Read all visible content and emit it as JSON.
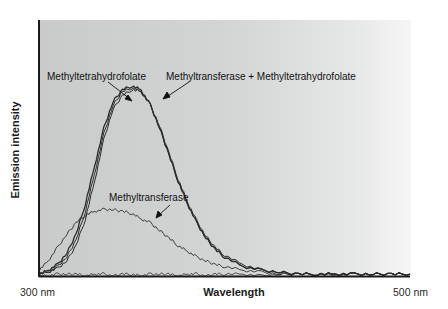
{
  "chart_data": {
    "type": "line",
    "title": "",
    "xlabel": "Wavelength",
    "ylabel": "Emission intensity",
    "x_tick_labels": [
      "300 nm",
      "500 nm"
    ],
    "xlim": [
      300,
      500
    ],
    "ylim": [
      0,
      100
    ],
    "grid": false,
    "legend": "none (inline annotations with arrows)",
    "x": [
      300,
      305,
      310,
      315,
      320,
      325,
      330,
      335,
      340,
      345,
      350,
      355,
      360,
      365,
      370,
      375,
      380,
      385,
      390,
      395,
      400,
      410,
      420,
      430,
      440,
      450,
      460,
      470,
      480,
      490,
      500
    ],
    "series": [
      {
        "name": "Methyltetrahydrofolate",
        "values": [
          1,
          3,
          6,
          12,
          22,
          38,
          58,
          78,
          92,
          98,
          100,
          98,
          90,
          78,
          64,
          50,
          38,
          28,
          20,
          14,
          10,
          5,
          3,
          2,
          1,
          1,
          1,
          1,
          1,
          1,
          1
        ]
      },
      {
        "name": "Methyltransferase + Methyltetrahydrofolate",
        "values": [
          1,
          2,
          4,
          8,
          16,
          30,
          50,
          72,
          88,
          95,
          98,
          97,
          90,
          79,
          65,
          51,
          39,
          29,
          21,
          15,
          11,
          6,
          3,
          2,
          1,
          1,
          1,
          1,
          1,
          1,
          1
        ]
      },
      {
        "name": "Methyltetrahydrofolate (repeat trace)",
        "values": [
          1,
          2,
          5,
          10,
          19,
          34,
          54,
          75,
          90,
          97,
          99,
          97,
          90,
          78,
          64,
          50,
          38,
          28,
          20,
          14,
          10,
          5,
          3,
          2,
          1,
          1,
          1,
          1,
          1,
          1,
          1
        ]
      },
      {
        "name": "Methyltransferase",
        "values": [
          3,
          8,
          15,
          22,
          28,
          32,
          34,
          35,
          35,
          34,
          33,
          30,
          28,
          24,
          20,
          16,
          13,
          10,
          8,
          6,
          5,
          3,
          2,
          1,
          1,
          1,
          1,
          1,
          1,
          1,
          1
        ]
      },
      {
        "name": "Baseline",
        "values": [
          0,
          0,
          1,
          1,
          1,
          0,
          1,
          1,
          0,
          1,
          1,
          0,
          1,
          1,
          1,
          0,
          1,
          1,
          0,
          1,
          1,
          1,
          0,
          1,
          1,
          1,
          0,
          1,
          1,
          1,
          1
        ]
      }
    ],
    "annotations": [
      {
        "text": "Methyltetrahydrofolate",
        "points_to": "Methyltetrahydrofolate peak"
      },
      {
        "text": "Methyltransferase + Methyltetrahydrofolate",
        "points_to": "combined peak"
      },
      {
        "text": "Methyltransferase",
        "points_to": "Methyltransferase curve"
      }
    ]
  },
  "axes": {
    "xlabel": "Wavelength",
    "ylabel": "Emission intensity",
    "x_start": "300 nm",
    "x_end": "500 nm"
  },
  "annotations": {
    "mthf": "Methyltetrahydrofolate",
    "combo": "Methyltransferase + Methyltetrahydrofolate",
    "mt": "Methyltransferase"
  },
  "colors": {
    "line": "#2b2b2b",
    "axis": "#1a1a1a",
    "plot_bg": "#d0d2d2"
  }
}
